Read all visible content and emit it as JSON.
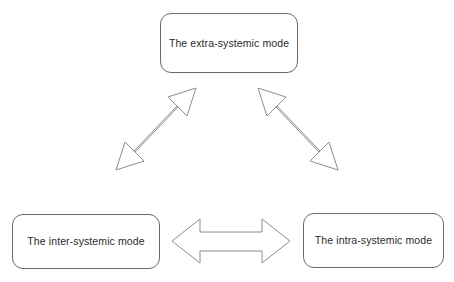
{
  "diagram": {
    "background_color": "#ffffff",
    "node_border_color": "#6b6b6b",
    "node_fill_color": "#ffffff",
    "arrow_stroke_color": "#8c8c8c",
    "arrow_fill_color": "#ffffff",
    "text_color": "#2b2b2b",
    "nodes": [
      {
        "id": "extra-systemic",
        "label": "The extra-systemic mode",
        "position": "top"
      },
      {
        "id": "inter-systemic",
        "label": "The inter-systemic mode",
        "position": "bottom-left"
      },
      {
        "id": "intra-systemic",
        "label": "The intra-systemic mode",
        "position": "bottom-right"
      }
    ],
    "connectors": [
      {
        "id": "left-diagonal",
        "from": "inter-systemic",
        "to": "extra-systemic",
        "style": "double-headed-arrow",
        "orientation": "diagonal-up-right"
      },
      {
        "id": "right-diagonal",
        "from": "extra-systemic",
        "to": "intra-systemic",
        "style": "double-headed-arrow",
        "orientation": "diagonal-down-right"
      },
      {
        "id": "bottom-horizontal",
        "from": "inter-systemic",
        "to": "intra-systemic",
        "style": "double-headed-arrow",
        "orientation": "horizontal"
      }
    ]
  }
}
